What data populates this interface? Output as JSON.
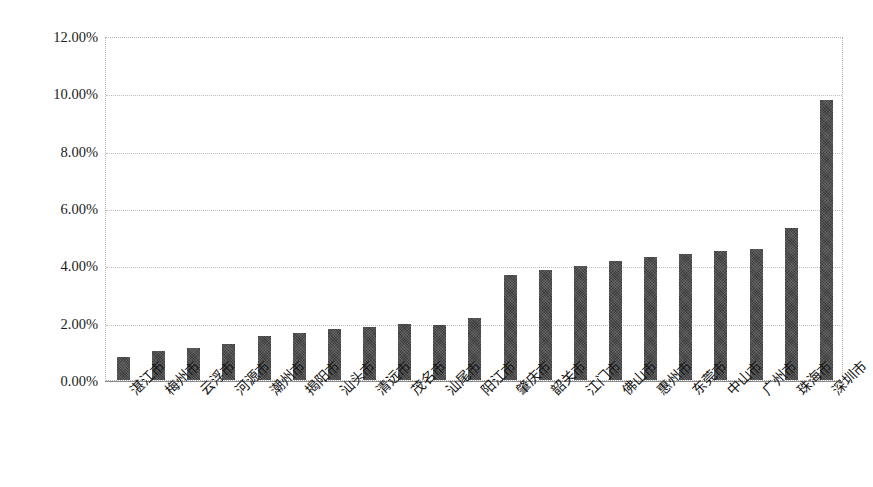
{
  "chart_data": {
    "type": "bar",
    "title": "",
    "subtitle": "",
    "xlabel": "",
    "ylabel": "",
    "ylim": [
      0,
      12
    ],
    "yticks": [
      0,
      2,
      4,
      6,
      8,
      10,
      12
    ],
    "ytick_labels": [
      "0.00%",
      "2.00%",
      "4.00%",
      "6.00%",
      "8.00%",
      "10.00%",
      "12.00%"
    ],
    "grid": true,
    "legend": null,
    "value_unit": "%",
    "bar_color": "#3b3b3b",
    "categories": [
      "湛江市",
      "梅州市",
      "云浮市",
      "河源市",
      "潮州市",
      "揭阳市",
      "汕头市",
      "清远市",
      "茂名市",
      "汕尾市",
      "阳江市",
      "肇庆市",
      "韶关市",
      "江门市",
      "佛山市",
      "惠州市",
      "东莞市",
      "中山市",
      "广州市",
      "珠海市",
      "深圳市"
    ],
    "values": [
      0.8,
      1.0,
      1.12,
      1.25,
      1.52,
      1.65,
      1.78,
      1.85,
      1.96,
      1.93,
      2.15,
      3.65,
      3.85,
      3.98,
      4.15,
      4.28,
      4.4,
      4.5,
      4.58,
      5.3,
      9.78
    ],
    "x_tick_rotation": -45
  },
  "axes": {
    "y_axis_name": "percentage-axis",
    "x_axis_name": "city-axis"
  }
}
